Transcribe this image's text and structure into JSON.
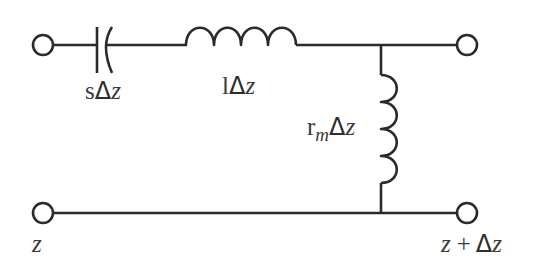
{
  "diagram": {
    "title": "",
    "type": "transmission-line-segment-equivalent-circuit",
    "components": [
      {
        "id": "capacitor-series",
        "kind": "capacitor",
        "label": {
          "prefix": "s",
          "delta": "Δ",
          "var": "z"
        }
      },
      {
        "id": "inductor-series",
        "kind": "inductor",
        "label": {
          "prefix": "l",
          "delta": "Δ",
          "var": "z"
        }
      },
      {
        "id": "inductor-shunt",
        "kind": "inductor",
        "label": {
          "prefix": "r",
          "subscript": "m",
          "delta": "Δ",
          "var": "z"
        }
      }
    ],
    "terminals": [
      {
        "id": "in-top"
      },
      {
        "id": "out-top"
      },
      {
        "id": "in-bottom"
      },
      {
        "id": "out-bottom"
      }
    ],
    "port_labels": {
      "left": {
        "var": "z"
      },
      "right": {
        "var": "z",
        "plus": "+",
        "delta": "Δ",
        "var2": "z"
      }
    }
  }
}
